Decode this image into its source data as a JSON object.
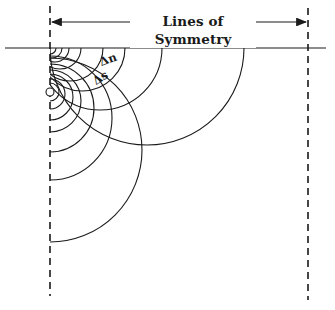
{
  "diagram": {
    "title": "Lines of Symmetry",
    "labels": {
      "delta_n": "Δn",
      "delta_s": "Δs"
    },
    "colors": {
      "line": "#1a1a1a",
      "background": "#ffffff"
    },
    "geometry": {
      "surface_line": {
        "x1": 5,
        "x2": 326,
        "y": 48
      },
      "left_symmetry_line": {
        "x": 50,
        "y1": 6,
        "y2": 296
      },
      "right_symmetry_line": {
        "x": 308,
        "y1": 8,
        "y2": 300
      },
      "arrow": {
        "y": 22,
        "x1": 52,
        "x2": 306
      },
      "source_point": {
        "x": 50,
        "y": 92,
        "r": 4
      }
    },
    "equipotential_circles": [
      {
        "cx": 50,
        "cy": 92,
        "r": 9
      },
      {
        "cx": 50,
        "cy": 94,
        "r": 15
      },
      {
        "cx": 50,
        "cy": 97,
        "r": 23
      },
      {
        "cx": 50,
        "cy": 101,
        "r": 31
      },
      {
        "cx": 50,
        "cy": 108,
        "r": 44
      },
      {
        "cx": 50,
        "cy": 118,
        "r": 62
      },
      {
        "cx": 50,
        "cy": 150,
        "r": 92
      }
    ],
    "flow_circles": [
      {
        "cx": 50,
        "cy": 48,
        "r": 6
      },
      {
        "cx": 52,
        "cy": 48,
        "r": 10
      },
      {
        "cx": 55,
        "cy": 48,
        "r": 14
      },
      {
        "cx": 60,
        "cy": 48,
        "r": 21
      },
      {
        "cx": 70,
        "cy": 48,
        "r": 33
      },
      {
        "cx": 82,
        "cy": 48,
        "r": 43
      },
      {
        "cx": 100,
        "cy": 48,
        "r": 62
      },
      {
        "cx": 147,
        "cy": 48,
        "r": 97
      }
    ]
  }
}
